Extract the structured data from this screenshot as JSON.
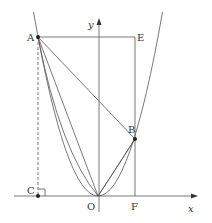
{
  "diagram": {
    "type": "parabola-geometry",
    "labels": {
      "A": "A",
      "B": "B",
      "C": "C",
      "E": "E",
      "F": "F",
      "O": "O",
      "x_axis": "x",
      "y_axis": "y"
    },
    "colors": {
      "stroke": "#555555",
      "point": "#222222"
    }
  }
}
